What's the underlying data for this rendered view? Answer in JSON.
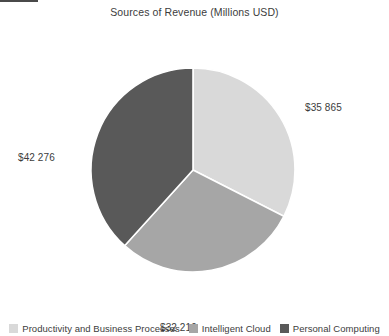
{
  "chart_data": {
    "type": "pie",
    "title": "Sources of Revenue (Millions USD)",
    "categories": [
      "Productivity and Business Processes",
      "Intelligent Cloud",
      "Personal Computing"
    ],
    "values": [
      35865,
      32219,
      42276
    ],
    "value_labels": [
      "$35 865",
      "$32 219",
      "$42 276"
    ],
    "colors": [
      "#d9d9d9",
      "#a6a6a6",
      "#595959"
    ],
    "slice_percents": [
      32.5,
      29.2,
      38.3
    ],
    "start_angle_deg": 0,
    "direction": "clockwise",
    "legend_position": "bottom",
    "grid": false,
    "slice_border_color": "#ffffff",
    "background": "#ffffff"
  },
  "chart": {
    "title": "Sources of Revenue (Millions USD)",
    "label_right": "$35 865",
    "label_left": "$42 276",
    "label_bottom": "$32 219"
  },
  "legend": {
    "items": [
      {
        "label": "Productivity and Business Processes",
        "color": "#d9d9d9"
      },
      {
        "label": "Intelligent Cloud",
        "color": "#a6a6a6"
      },
      {
        "label": "Personal Computing",
        "color": "#595959"
      }
    ]
  }
}
